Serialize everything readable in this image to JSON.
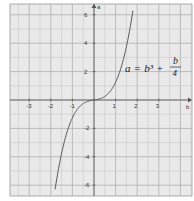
{
  "chart_data": {
    "type": "line",
    "title": "",
    "equation": {
      "lhs": "a",
      "eq": "=",
      "term1": "b³",
      "plus": "+",
      "frac_num": "b",
      "frac_den": "4"
    },
    "xlabel": "b",
    "ylabel": "a",
    "xlim": [
      -4,
      4.5
    ],
    "ylim": [
      -6.7,
      6.8
    ],
    "x_ticks": [
      -3,
      -2,
      -1,
      1,
      2,
      3
    ],
    "x_tick_labels": [
      "-3",
      "-2",
      "-1",
      "1",
      "2",
      "3"
    ],
    "y_ticks": [
      6,
      4,
      2,
      -2,
      -4,
      -6
    ],
    "y_tick_labels": [
      "6",
      "4",
      "2",
      "-2",
      "-4",
      "-6"
    ],
    "grid": true,
    "series": [
      {
        "name": "a = b^3 + b/4",
        "x": [
          -1.8,
          -1.6,
          -1.4,
          -1.2,
          -1.0,
          -0.8,
          -0.6,
          -0.4,
          -0.2,
          0,
          0.2,
          0.4,
          0.6,
          0.8,
          1.0,
          1.2,
          1.4,
          1.6,
          1.8
        ],
        "values": [
          -6.28,
          -4.5,
          -3.09,
          -2.03,
          -1.25,
          -0.71,
          -0.37,
          -0.16,
          -0.06,
          0,
          0.06,
          0.16,
          0.37,
          0.71,
          1.25,
          2.03,
          3.09,
          4.5,
          6.28
        ]
      }
    ]
  }
}
